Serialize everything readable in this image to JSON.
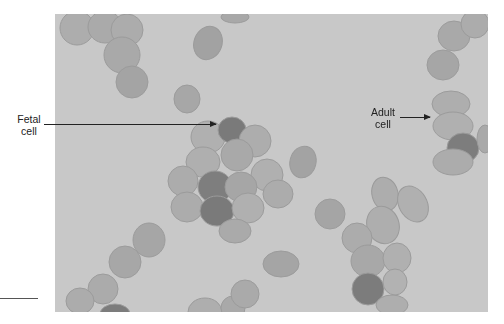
{
  "figure": {
    "colors": {
      "background": "#c8c8c8",
      "adult_cell": "#a9a9a9",
      "adult_cell_edge": "#999999",
      "fetal_cell": "#7a7a7a",
      "label_text": "#222222"
    }
  },
  "labels": {
    "fetal": {
      "line1": "Fetal",
      "line2": "cell"
    },
    "adult": {
      "line1": "Adult",
      "line2": "cell"
    }
  }
}
